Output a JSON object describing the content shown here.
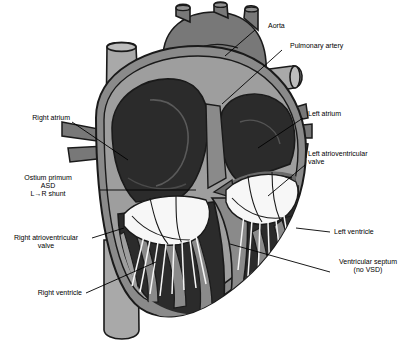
{
  "figure": {
    "type": "anatomical-illustration",
    "style": "grayscale line drawing"
  },
  "palette": {
    "background": "#ffffff",
    "outline": "#1a1a1a",
    "myocardium": "#8a8a8a",
    "myocardium_light": "#9e9e9e",
    "chamber_dark": "#2b2b2b",
    "chamber_mid": "#3d3d3d",
    "vessel_light": "#a9a9a9",
    "vessel_mid": "#787878",
    "vessel_dark": "#6a6a6a",
    "valve_white": "#f7f7f7",
    "text": "#000000"
  },
  "labels": {
    "aorta": "Aorta",
    "pulmonary_artery": "Pulmonary artery",
    "right_atrium": "Right atrium",
    "left_atrium": "Left atrium",
    "left_av_valve_l1": "Left atrioventricular",
    "left_av_valve_l2": "valve",
    "ostium_l1": "Ostium primum",
    "ostium_l2": "ASD",
    "ostium_l3": "L→R shunt",
    "right_av_valve_l1": "Right atrioventricular",
    "right_av_valve_l2": "valve",
    "right_ventricle": "Right ventricle",
    "left_ventricle": "Left ventricle",
    "ventricular_septum_l1": "Ventricular septum",
    "ventricular_septum_l2": "(no VSD)"
  },
  "structures": [
    {
      "name": "aorta",
      "shade": "vessel_mid"
    },
    {
      "name": "pulmonary-artery",
      "shade": "vessel_light"
    },
    {
      "name": "superior-vena-cava",
      "shade": "vessel_light"
    },
    {
      "name": "inferior-vena-cava",
      "shade": "vessel_light"
    },
    {
      "name": "right-atrium-chamber",
      "shade": "chamber_dark"
    },
    {
      "name": "left-atrium-chamber",
      "shade": "chamber_dark"
    },
    {
      "name": "right-ventricle-chamber",
      "shade": "chamber_dark"
    },
    {
      "name": "left-ventricle-chamber",
      "shade": "chamber_dark"
    },
    {
      "name": "ventricular-septum",
      "shade": "myocardium"
    },
    {
      "name": "mitral-valve-leaflets",
      "shade": "valve_white"
    },
    {
      "name": "tricuspid-valve-leaflets",
      "shade": "valve_white"
    },
    {
      "name": "chordae-tendineae",
      "shade": "valve_white"
    },
    {
      "name": "asd-shunt-arrow",
      "shade": "vessel_dark"
    }
  ]
}
